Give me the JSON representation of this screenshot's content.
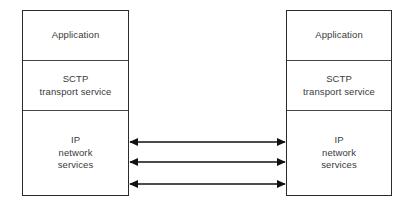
{
  "diagram": {
    "type": "block-diagram",
    "background_color": "#ffffff",
    "border_color": "#2b2b2b",
    "text_color": "#3a3a3a",
    "endpoints": [
      {
        "id": "left-endpoint",
        "layers": [
          {
            "id": "application",
            "lines": [
              "Application"
            ]
          },
          {
            "id": "transport",
            "lines": [
              "SCTP",
              "transport service"
            ]
          },
          {
            "id": "network",
            "lines": [
              "IP",
              "network",
              "services"
            ]
          }
        ]
      },
      {
        "id": "right-endpoint",
        "layers": [
          {
            "id": "application",
            "lines": [
              "Application"
            ]
          },
          {
            "id": "transport",
            "lines": [
              "SCTP",
              "transport service"
            ]
          },
          {
            "id": "network",
            "lines": [
              "IP",
              "network",
              "services"
            ]
          }
        ]
      }
    ],
    "connectors": {
      "count": 3,
      "style": "double-headed-arrow",
      "color": "#111111",
      "label": "",
      "items": [
        {
          "id": "path-1",
          "label": ""
        },
        {
          "id": "path-2",
          "label": ""
        },
        {
          "id": "path-3",
          "label": ""
        }
      ]
    }
  }
}
